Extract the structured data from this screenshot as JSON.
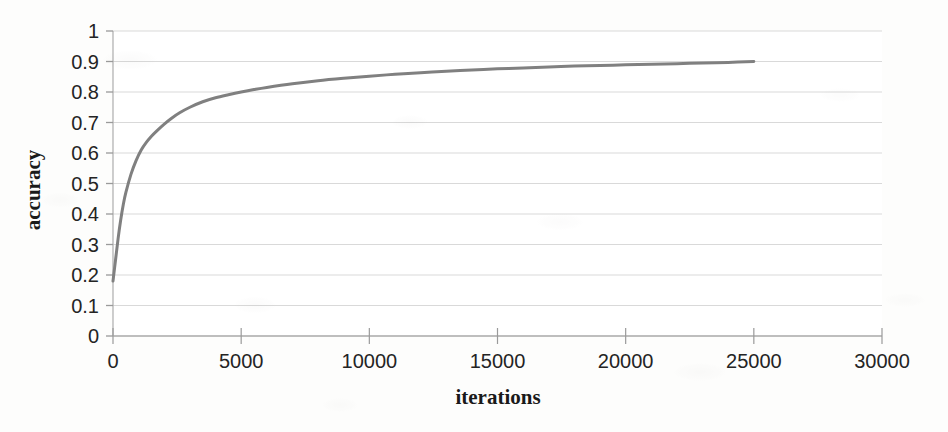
{
  "chart_data": {
    "type": "line",
    "title": "",
    "xlabel": "iterations",
    "ylabel": "accuracy",
    "xlim": [
      0,
      30000
    ],
    "ylim": [
      0,
      1
    ],
    "xticks": [
      "0",
      "5000",
      "10000",
      "15000",
      "20000",
      "25000",
      "30000"
    ],
    "xtick_values": [
      0,
      5000,
      10000,
      15000,
      20000,
      25000,
      30000
    ],
    "yticks": [
      "0",
      "0.1",
      "0.2",
      "0.3",
      "0.4",
      "0.5",
      "0.6",
      "0.7",
      "0.8",
      "0.9",
      "1"
    ],
    "ytick_values": [
      0,
      0.1,
      0.2,
      0.3,
      0.4,
      0.5,
      0.6,
      0.7,
      0.8,
      0.9,
      1
    ],
    "grid": "horizontal",
    "legend": "none",
    "series": [
      {
        "name": "accuracy",
        "color": "#808080",
        "line_width": 3,
        "x": [
          0,
          100,
          200,
          300,
          400,
          500,
          700,
          900,
          1100,
          1300,
          1500,
          1700,
          2000,
          2300,
          2600,
          3000,
          3500,
          4000,
          4500,
          5000,
          5500,
          6000,
          7000,
          8000,
          9000,
          10000,
          11000,
          12000,
          13000,
          14000,
          15000,
          16000,
          17000,
          18000,
          19000,
          20000,
          21000,
          22000,
          23000,
          24000,
          25000
        ],
        "y": [
          0.18,
          0.25,
          0.32,
          0.38,
          0.43,
          0.47,
          0.53,
          0.575,
          0.61,
          0.635,
          0.655,
          0.672,
          0.695,
          0.715,
          0.732,
          0.75,
          0.768,
          0.781,
          0.791,
          0.8,
          0.808,
          0.815,
          0.827,
          0.837,
          0.845,
          0.852,
          0.858,
          0.863,
          0.868,
          0.872,
          0.876,
          0.879,
          0.882,
          0.885,
          0.887,
          0.889,
          0.891,
          0.893,
          0.895,
          0.897,
          0.9
        ]
      }
    ]
  },
  "colors": {
    "curve": "#808080",
    "grid": "#d9d9d9",
    "axis": "#b0b0b0",
    "tick_text": "#242424",
    "axis_label": "#1a1a1a",
    "background": "#fdfdfc"
  }
}
